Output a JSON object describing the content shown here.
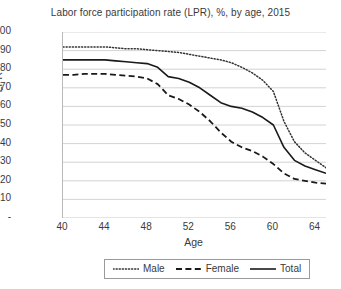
{
  "chart_data": {
    "type": "line",
    "title": "Labor force participation rate (LPR), %, by age, 2015",
    "xlabel": "Age",
    "ylabel": "LPR",
    "xlim": [
      40,
      65
    ],
    "ylim": [
      0,
      100
    ],
    "grid": true,
    "legend_position": "bottom",
    "x_ticks": [
      "40",
      "44",
      "48",
      "52",
      "56",
      "60",
      "64"
    ],
    "x_tick_values": [
      40,
      44,
      48,
      52,
      56,
      60,
      64
    ],
    "y_ticks": [
      "-",
      "10",
      "20",
      "30",
      "40",
      "50",
      "60",
      "70",
      "80",
      "90",
      "100"
    ],
    "y_tick_values": [
      0,
      10,
      20,
      30,
      40,
      50,
      60,
      70,
      80,
      90,
      100
    ],
    "x": [
      40,
      41,
      42,
      43,
      44,
      45,
      46,
      47,
      48,
      49,
      50,
      51,
      52,
      53,
      54,
      55,
      56,
      57,
      58,
      59,
      60,
      61,
      62,
      63,
      64,
      65
    ],
    "series": [
      {
        "name": "Male",
        "style": "dotted",
        "color": "#333333",
        "values": [
          92,
          92,
          92,
          92,
          92,
          91.5,
          91,
          91,
          90.5,
          90,
          89.5,
          89,
          88,
          87,
          86,
          85,
          83.5,
          81,
          78,
          74,
          68,
          52,
          41,
          35,
          31,
          27
        ]
      },
      {
        "name": "Female",
        "style": "dashed",
        "color": "#1a1a1a",
        "values": [
          77,
          77,
          77.5,
          77.5,
          77.5,
          77,
          76.5,
          76,
          75,
          72,
          66,
          64,
          61,
          57,
          52,
          46,
          41,
          38,
          36,
          33,
          29,
          24,
          21,
          20,
          19,
          18.5
        ]
      },
      {
        "name": "Total",
        "style": "solid",
        "color": "#1a1a1a",
        "values": [
          85,
          85,
          85,
          85,
          85,
          84.5,
          84,
          83.5,
          83,
          81,
          76,
          75,
          73,
          70,
          66,
          62,
          60,
          59,
          57,
          54,
          50,
          38,
          31,
          28,
          26,
          24
        ]
      }
    ]
  }
}
